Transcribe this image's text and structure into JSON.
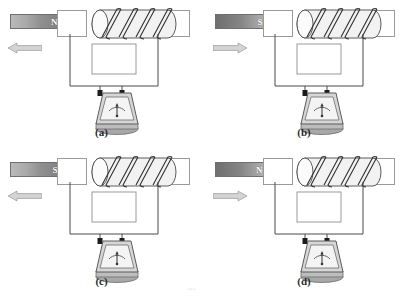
{
  "figure": {
    "colors": {
      "magnet_dark": "#7d7d7d",
      "magnet_light": "#bcbcbc",
      "outline": "#4a4a4a",
      "coil_line": "#3a3a3a",
      "box_border": "#9a9a9a",
      "arrow_fill": "#d4d4d4",
      "arrow_stroke": "#9a9a9a",
      "galv_body": "#cfcfcf",
      "caption_color": "#2b2b2b"
    },
    "panels": [
      {
        "id": "a",
        "caption": "(a)",
        "magnet": {
          "pole_label": "N",
          "pole_position": "right",
          "gradient": "light-to-dark"
        },
        "motion": {
          "direction": "left",
          "arrow_glyph": "←"
        },
        "solenoid": {
          "turns": 4,
          "orientation": "horizontal"
        },
        "meter": {
          "type": "galvanometer",
          "needle_position": "center",
          "terminals": 2
        }
      },
      {
        "id": "b",
        "caption": "(b)",
        "magnet": {
          "pole_label": "S",
          "pole_position": "right",
          "gradient": "dark-to-light"
        },
        "motion": {
          "direction": "right",
          "arrow_glyph": "→"
        },
        "solenoid": {
          "turns": 4,
          "orientation": "horizontal"
        },
        "meter": {
          "type": "galvanometer",
          "needle_position": "center",
          "terminals": 2
        }
      },
      {
        "id": "c",
        "caption": "(c)",
        "magnet": {
          "pole_label": "S",
          "pole_position": "right",
          "gradient": "light-to-dark"
        },
        "motion": {
          "direction": "left",
          "arrow_glyph": "←"
        },
        "solenoid": {
          "turns": 4,
          "orientation": "horizontal"
        },
        "meter": {
          "type": "galvanometer",
          "needle_position": "center",
          "terminals": 2
        }
      },
      {
        "id": "d",
        "caption": "(d)",
        "magnet": {
          "pole_label": "N",
          "pole_position": "right",
          "gradient": "dark-to-light"
        },
        "motion": {
          "direction": "right",
          "arrow_glyph": "→"
        },
        "solenoid": {
          "turns": 4,
          "orientation": "horizontal"
        },
        "meter": {
          "type": "galvanometer",
          "needle_position": "center",
          "terminals": 2
        }
      }
    ],
    "footer_artifact": "▫▫▫"
  }
}
